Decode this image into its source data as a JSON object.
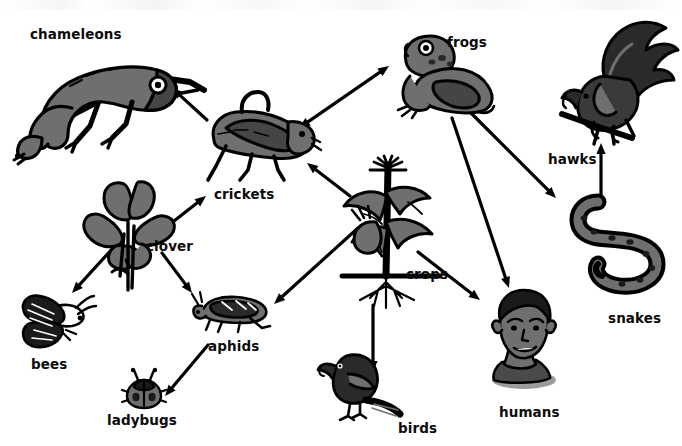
{
  "diagram": {
    "background_color": "#ffffff",
    "ink_color": "#000000",
    "fill_gray": "#6f6f6f",
    "style": "black and white clip-art food web on white background"
  },
  "nodes": [
    {
      "id": "chameleons",
      "label": "chameleons",
      "icon": "chameleon-icon",
      "label_x": 30,
      "label_y": 28,
      "art_x": 12,
      "art_y": 38,
      "art_w": 205,
      "art_h": 125
    },
    {
      "id": "crickets",
      "label": "crickets",
      "icon": "cricket-icon",
      "label_x": 214,
      "label_y": 188,
      "art_x": 196,
      "art_y": 88,
      "art_w": 125,
      "art_h": 95
    },
    {
      "id": "frogs",
      "label": "frogs",
      "icon": "frog-icon",
      "label_x": 447,
      "label_y": 36,
      "art_x": 392,
      "art_y": 28,
      "art_w": 110,
      "art_h": 92
    },
    {
      "id": "hawks",
      "label": "hawks",
      "icon": "hawk-icon",
      "label_x": 548,
      "label_y": 153,
      "art_x": 560,
      "art_y": 18,
      "art_w": 120,
      "art_h": 135
    },
    {
      "id": "snakes",
      "label": "snakes",
      "icon": "snake-icon",
      "label_x": 608,
      "label_y": 312,
      "art_x": 560,
      "art_y": 200,
      "art_w": 115,
      "art_h": 110
    },
    {
      "id": "clover",
      "label": "clover",
      "icon": "clover-icon",
      "label_x": 146,
      "label_y": 240,
      "art_x": 80,
      "art_y": 178,
      "art_w": 100,
      "art_h": 115
    },
    {
      "id": "bees",
      "label": "bees",
      "icon": "bee-icon",
      "label_x": 31,
      "label_y": 358,
      "art_x": 18,
      "art_y": 288,
      "art_w": 78,
      "art_h": 62
    },
    {
      "id": "aphids",
      "label": "aphids",
      "icon": "aphid-icon",
      "label_x": 208,
      "label_y": 340,
      "art_x": 188,
      "art_y": 288,
      "art_w": 85,
      "art_h": 48
    },
    {
      "id": "ladybugs",
      "label": "ladybugs",
      "icon": "ladybug-icon",
      "label_x": 107,
      "label_y": 414,
      "art_x": 122,
      "art_y": 368,
      "art_w": 44,
      "art_h": 42
    },
    {
      "id": "crops",
      "label": "crops",
      "icon": "corn-plant-icon",
      "label_x": 406,
      "label_y": 268,
      "art_x": 330,
      "art_y": 158,
      "art_w": 120,
      "art_h": 150
    },
    {
      "id": "birds",
      "label": "birds",
      "icon": "bird-icon",
      "label_x": 398,
      "label_y": 422,
      "art_x": 318,
      "art_y": 348,
      "art_w": 85,
      "art_h": 72
    },
    {
      "id": "humans",
      "label": "humans",
      "icon": "human-head-icon",
      "label_x": 499,
      "label_y": 406,
      "art_x": 478,
      "art_y": 288,
      "art_w": 88,
      "art_h": 102
    }
  ],
  "arrows": [
    {
      "from": "crickets",
      "to": "chameleons",
      "double": false,
      "x1": 207,
      "y1": 120,
      "x2": 172,
      "y2": 88
    },
    {
      "from": "crickets",
      "to": "frogs",
      "double": true,
      "x1": 299,
      "y1": 128,
      "x2": 389,
      "y2": 66
    },
    {
      "from": "crops",
      "to": "crickets",
      "double": false,
      "x1": 350,
      "y1": 196,
      "x2": 307,
      "y2": 163
    },
    {
      "from": "clover",
      "to": "crickets",
      "double": false,
      "x1": 160,
      "y1": 232,
      "x2": 206,
      "y2": 196
    },
    {
      "from": "clover",
      "to": "bees",
      "double": false,
      "x1": 113,
      "y1": 248,
      "x2": 72,
      "y2": 293
    },
    {
      "from": "clover",
      "to": "aphids",
      "double": false,
      "x1": 162,
      "y1": 253,
      "x2": 192,
      "y2": 293
    },
    {
      "from": "crops",
      "to": "aphids",
      "double": false,
      "x1": 358,
      "y1": 228,
      "x2": 274,
      "y2": 304
    },
    {
      "from": "aphids",
      "to": "ladybugs",
      "double": false,
      "x1": 208,
      "y1": 345,
      "x2": 165,
      "y2": 396
    },
    {
      "from": "crops",
      "to": "humans",
      "double": false,
      "x1": 418,
      "y1": 252,
      "x2": 480,
      "y2": 300
    },
    {
      "from": "crops",
      "to": "birds",
      "double": false,
      "x1": 373,
      "y1": 305,
      "x2": 373,
      "y2": 372
    },
    {
      "from": "frogs",
      "to": "humans",
      "double": false,
      "x1": 452,
      "y1": 118,
      "x2": 509,
      "y2": 288
    },
    {
      "from": "frogs",
      "to": "snakes",
      "double": false,
      "x1": 470,
      "y1": 112,
      "x2": 556,
      "y2": 198
    },
    {
      "from": "snakes",
      "to": "hawks",
      "double": false,
      "x1": 601,
      "y1": 200,
      "x2": 601,
      "y2": 143
    }
  ]
}
